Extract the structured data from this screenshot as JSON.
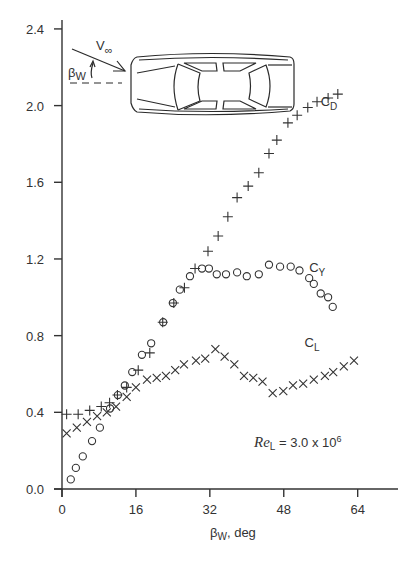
{
  "chart_data": {
    "type": "scatter",
    "title": "",
    "xlabel": "βW, deg",
    "ylabel": "",
    "xlim": [
      0,
      68
    ],
    "ylim": [
      0.0,
      2.4
    ],
    "x_ticks": [
      0,
      16,
      32,
      48,
      64
    ],
    "x_tick_labels": [
      "0",
      "16",
      "32",
      "48",
      "64"
    ],
    "y_ticks": [
      0.0,
      0.4,
      0.8,
      1.2,
      1.6,
      2.0,
      2.4
    ],
    "y_tick_labels": [
      "0.0",
      "0.4",
      "0.8",
      "1.2",
      "1.6",
      "2.0",
      "2.4"
    ],
    "grid": false,
    "legend_position": "inline labels next to each series",
    "annotation": {
      "text_main": "Re",
      "text_sub": "L",
      "text_rest": " = 3.0 x 10",
      "text_sup": "6"
    },
    "inset": {
      "description": "top view of car with yaw angle",
      "velocity_label": "V",
      "velocity_sub": "∞",
      "angle_label": "β",
      "angle_sub": "W"
    },
    "series": [
      {
        "name": "CD",
        "label_main": "C",
        "label_sub": "D",
        "marker": "plus",
        "label_pos": [
          56,
          2.0
        ],
        "x": [
          1.0,
          3.5,
          6.0,
          8.5,
          10.3,
          12.0,
          14.0,
          16.5,
          19.0,
          21.8,
          24.2,
          26.5,
          28.8,
          31.6,
          33.8,
          35.9,
          37.9,
          40.3,
          42.6,
          44.8,
          46.5,
          48.9,
          50.9,
          53.2,
          55.2,
          57.6,
          59.7
        ],
        "y": [
          0.39,
          0.39,
          0.41,
          0.43,
          0.45,
          0.49,
          0.53,
          0.62,
          0.71,
          0.87,
          0.97,
          1.05,
          1.15,
          1.24,
          1.32,
          1.42,
          1.52,
          1.58,
          1.65,
          1.75,
          1.82,
          1.91,
          1.95,
          1.99,
          2.02,
          2.04,
          2.06
        ]
      },
      {
        "name": "CY",
        "label_main": "C",
        "label_sub": "Y",
        "marker": "circle",
        "label_pos": [
          53.5,
          1.13
        ],
        "x": [
          1.9,
          3.0,
          4.5,
          6.5,
          8.2,
          10.4,
          12.1,
          13.6,
          15.2,
          17.3,
          19.3,
          21.9,
          24.0,
          25.5,
          27.7,
          30.3,
          31.8,
          33.5,
          35.5,
          37.9,
          40.0,
          42.6,
          44.8,
          47.2,
          49.5,
          51.4,
          53.5,
          54.5,
          56.0,
          57.6,
          58.6
        ],
        "y": [
          0.05,
          0.11,
          0.17,
          0.25,
          0.32,
          0.42,
          0.49,
          0.54,
          0.61,
          0.7,
          0.76,
          0.87,
          0.97,
          1.04,
          1.11,
          1.15,
          1.15,
          1.12,
          1.12,
          1.13,
          1.11,
          1.12,
          1.17,
          1.16,
          1.16,
          1.14,
          1.1,
          1.07,
          1.02,
          1.0,
          0.95
        ]
      },
      {
        "name": "CL",
        "label_main": "C",
        "label_sub": "L",
        "marker": "cross",
        "label_pos": [
          52.5,
          0.74
        ],
        "x": [
          1.0,
          3.2,
          5.4,
          7.6,
          9.7,
          11.7,
          14.0,
          16.0,
          18.4,
          20.5,
          22.5,
          24.5,
          26.4,
          29.0,
          31.0,
          33.2,
          35.2,
          37.3,
          39.4,
          41.4,
          43.4,
          45.6,
          47.9,
          50.0,
          52.2,
          54.5,
          56.9,
          58.7,
          61.0,
          63.2
        ],
        "y": [
          0.29,
          0.32,
          0.35,
          0.38,
          0.4,
          0.43,
          0.48,
          0.53,
          0.57,
          0.58,
          0.59,
          0.62,
          0.65,
          0.67,
          0.68,
          0.73,
          0.69,
          0.65,
          0.59,
          0.58,
          0.56,
          0.5,
          0.51,
          0.54,
          0.55,
          0.57,
          0.59,
          0.61,
          0.64,
          0.67
        ]
      }
    ]
  }
}
